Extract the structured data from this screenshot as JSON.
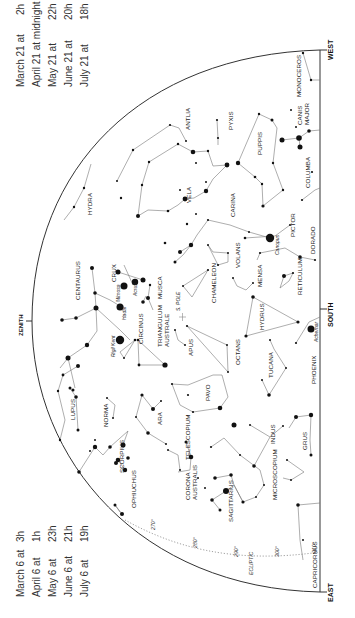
{
  "times_top": [
    {
      "date": "March 21 at",
      "time": "2h"
    },
    {
      "date": "April 21 at midnight",
      "time": ""
    },
    {
      "date": "May 21 at",
      "time": "22h"
    },
    {
      "date": "June 21 at",
      "time": "20h"
    },
    {
      "date": "July 21 at",
      "time": "18h"
    }
  ],
  "times_bottom": [
    {
      "date": "March 6 at",
      "time": "3h"
    },
    {
      "date": "April 6 at",
      "time": "1h"
    },
    {
      "date": "May 6 at",
      "time": "23h"
    },
    {
      "date": "June 6 at",
      "time": "21h"
    },
    {
      "date": "July 6 at",
      "time": "19h"
    }
  ],
  "directions": {
    "west": "WEST",
    "south": "SOUTH",
    "east": "EAST",
    "zenith": "ZENITH"
  },
  "constellations": {
    "monoceros": "MONOCEROS",
    "canis_major_1": "CANIS",
    "canis_major_2": "MAJOR",
    "pyxis": "PYXIS",
    "antlia": "ANTLIA",
    "puppis": "PUPPIS",
    "hydra": "HYDRA",
    "vela": "VELA",
    "columba": "COLUMBA",
    "carina": "CARINA",
    "pictor": "PICTOR",
    "dorado": "DORADO",
    "volans": "VOLANS",
    "mensa": "MENSA",
    "reticulum": "RETICULUM",
    "chameleon": "CHAMELEON",
    "hydrus": "HYDRUS",
    "crux": "CRUX",
    "musca": "MUSCA",
    "centaurus": "CENTAURUS",
    "circinus": "CIRCINUS",
    "triangulum_1": "TRIANGULUM",
    "triangulum_2": "AUSTRALE",
    "apus": "APUS",
    "octans": "OCTANS",
    "tucana": "TUCANA",
    "phoenix": "PHOENIX",
    "pavo": "PAVO",
    "lupus": "LUPUS",
    "norma": "NORMA",
    "ara": "ARA",
    "telescopium": "TELESCOPIUM",
    "indus": "INDUS",
    "grus": "GRUS",
    "scorpius": "SCORPIUS",
    "ophiuchus": "OPHIUCHUS",
    "corona_1": "CORONA",
    "corona_2": "AUSTRALIS",
    "microscopium": "MICROSCOPIUM",
    "sagittarius": "SAGITTARIUS",
    "capricornus": "CAPRICORNUS",
    "s_pole": "S. POLE"
  },
  "stars": {
    "canopus": "Canopus",
    "achernar": "Achernar",
    "mimosa": "Mimosa",
    "acrux": "Acrux",
    "hadar": "Hadar",
    "rigil_kent": "Rigil Kent"
  },
  "ecliptic": {
    "label": "ECLIPTIC",
    "ticks": [
      "270°",
      "280°",
      "290°",
      "300°",
      "310°"
    ]
  }
}
